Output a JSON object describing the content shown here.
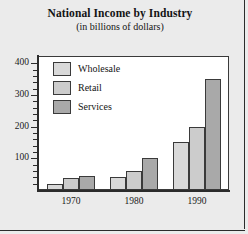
{
  "chart_data": {
    "type": "bar",
    "title": "National Income by Industry",
    "subtitle": "(in billions of dollars)",
    "xlabel": "",
    "ylabel": "",
    "categories": [
      "1970",
      "1980",
      "1990"
    ],
    "series": [
      {
        "name": "Wholesale",
        "values": [
          20,
          40,
          150
        ],
        "color": "#d9d9d9"
      },
      {
        "name": "Retail",
        "values": [
          38,
          60,
          200
        ],
        "color": "#cccccc"
      },
      {
        "name": "Services",
        "values": [
          45,
          100,
          350
        ],
        "color": "#a9a9a9"
      }
    ],
    "ylim": [
      0,
      420
    ],
    "yticks": [
      100,
      200,
      300,
      400
    ],
    "ytick_labels": [
      "100",
      "200",
      "300",
      "400"
    ],
    "yminor_step": 20,
    "grid": false,
    "legend_position": "upper-left"
  },
  "axis": {
    "y_labels": [
      "400",
      "300",
      "200",
      "100"
    ],
    "x_labels": [
      "1970",
      "1980",
      "1990"
    ]
  },
  "legend": {
    "items": [
      {
        "label": "Wholesale"
      },
      {
        "label": "Retail"
      },
      {
        "label": "Services"
      }
    ]
  },
  "colors": {
    "page_background": "#ebebeb",
    "plot_background": "#ffffff",
    "axis": "#2b2b2b",
    "bar_border": "#3a3a3a",
    "wholesale": "#d9d9d9",
    "retail": "#cccccc",
    "services": "#a9a9a9"
  }
}
